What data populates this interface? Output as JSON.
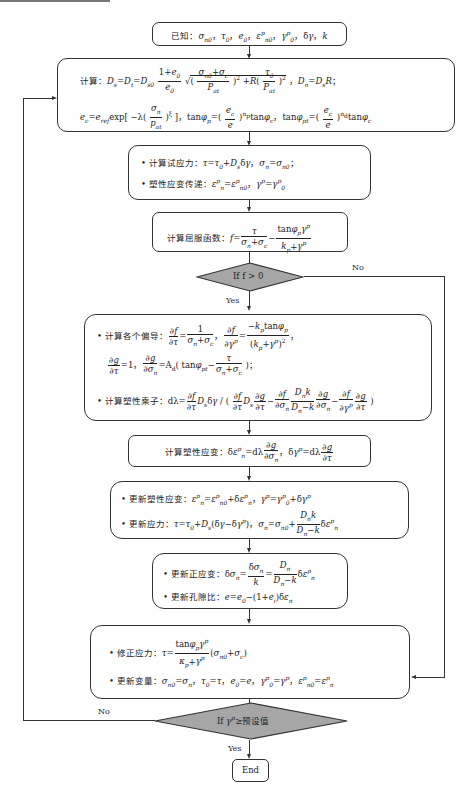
{
  "flowchart": {
    "start": {
      "text": "已知：σ_n0，τ_0，e_0，ε^p_n0，γ^p_0，δγ，k"
    },
    "compute": {
      "line1_prefix": "计算：",
      "line1": "D_s = D_t = D_s0 (1+e_0)/e_0 √( ((σ_n0+σ_c)/P_at)² + R(τ_0/P_at)² )，D_n = D_s R；",
      "line2": "e_c = e_ref exp[ −λ (σ_n/p_at)^ξ ]，tanφ_p = (e_c/e)^(n_p) tanφ_c，tanφ_pt = (e_c/e)^(n_d) tanφ_c"
    },
    "trial": {
      "item1_label": "计算试应力：",
      "item1": "τ = τ_0 + D_s δγ，σ_n = σ_n0；",
      "item2_label": "塑性应变传递：",
      "item2": "ε^p_n = ε^p_n0，γ^p = γ^p_0"
    },
    "yield": {
      "label": "计算屈服函数：",
      "formula": "f = τ/(σ_n+σ_c) − tanφ_p γ^p/(k_p+γ^p)"
    },
    "decision1": {
      "text": "If f > 0",
      "yes": "Yes",
      "no": "No"
    },
    "derivatives": {
      "item1_label": "计算各个偏导：",
      "item1": "∂f/∂τ = 1/(σ_n+σ_c)，∂f/∂γ^p = −k_p tanφ_p/(k_p+γ^p)²，",
      "item1b": "∂g/∂τ = 1，∂g/∂σ_n = A_d (tanφ_pt − τ/(σ_n+σ_c))；",
      "item2_label": "计算塑性乘子：",
      "item2": "dλ = ∂f/∂τ D_s δγ / ( ∂f/∂τ D_s ∂g/∂τ − ∂f/∂σ_n D_n k/(D_n−k) ∂g/∂σ_n − ∂f/∂γ^p ∂g/∂τ )"
    },
    "plastic_strain": {
      "label": "计算塑性应变：",
      "formula": "δε^p_n = dλ ∂g/∂σ_n，δγ^p = dλ ∂g/∂τ"
    },
    "update1": {
      "item1_label": "更新塑性应变：",
      "item1": "ε^p_n = ε^p_n0 + δε^p_n，γ^p = γ^p_0 + δγ^p",
      "item2_label": "更新应力：",
      "item2": "τ = τ_0 + D_s(δγ − δγ^p)，σ_n = σ_n0 + D_n k/(D_n−k) δε^p_n"
    },
    "update2": {
      "item1_label": "更新正应变：",
      "item1": "δσ_n = δσ_n/k = D_n/(D_n−k) δε^p_n",
      "item2_label": "更新孔隙比：",
      "item2": "e = e_0 − (1+e_i) δε_n"
    },
    "correct": {
      "item1_label": "修正应力：",
      "item1": "τ = tanφ_p γ^p/(κ_p+γ^p) (σ_n0+σ_c)",
      "item2_label": "更新变量：",
      "item2": "σ_n0 = σ_n，τ_0 = τ，e_0 = e，γ^p_0 = γ^p，ε^p_n0 = ε^p_n"
    },
    "decision2": {
      "text": "If γ^p ≥ 预设值",
      "yes": "Yes",
      "no": "No"
    },
    "end": {
      "text": "End"
    },
    "colors": {
      "decision_fill": "#a6a6a6",
      "stroke": "#333333",
      "background": "#ffffff"
    }
  }
}
